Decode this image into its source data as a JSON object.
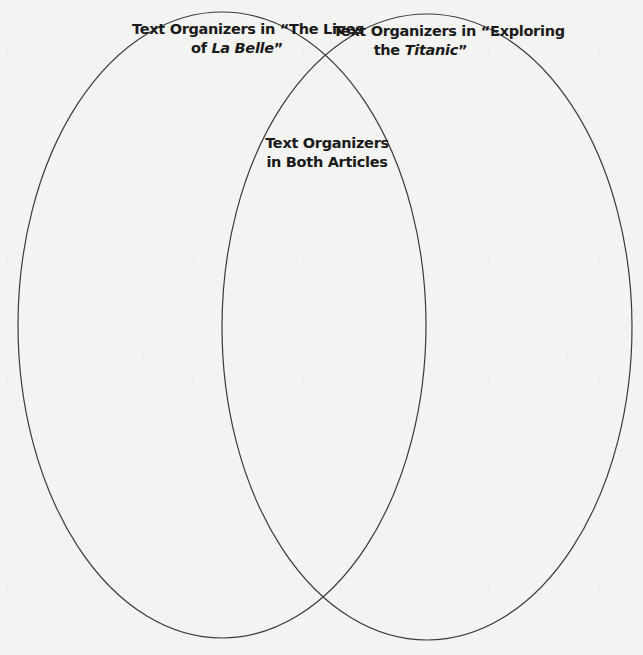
{
  "diagram": {
    "type": "venn",
    "stroke_color": "#3a3a3a",
    "background_color": "#f3f3f1",
    "circles": [
      {
        "id": "left",
        "label_line1": "Text Organizers in “The Lives",
        "label_line2_prefix": "of ",
        "label_line2_italic": "La Belle",
        "label_line2_suffix": "”"
      },
      {
        "id": "right",
        "label_line1": "Text Organizers in “Exploring",
        "label_line2_prefix": "the ",
        "label_line2_italic": "Titanic",
        "label_line2_suffix": "”"
      }
    ],
    "overlap": {
      "label_line1": "Text Organizers",
      "label_line2": "in Both Articles"
    }
  }
}
